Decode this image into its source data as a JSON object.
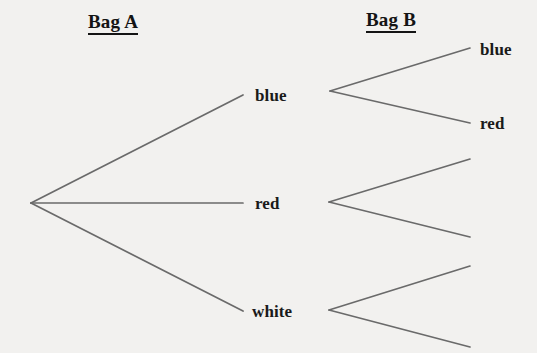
{
  "canvas": {
    "width": 537,
    "height": 353,
    "background_color": "#f2f1ef",
    "line_color": "#6a6a6a",
    "text_color": "#1a1a1a"
  },
  "headings": [
    {
      "id": "bag-a",
      "label": "Bag A",
      "x": 88,
      "y": 12
    },
    {
      "id": "bag-b",
      "label": "Bag B",
      "x": 366,
      "y": 10
    }
  ],
  "nodes": {
    "root": {
      "id": "root",
      "label": "",
      "x": 30,
      "y": 203
    },
    "stage1": [
      {
        "id": "stage1-blue",
        "label": "blue",
        "x": 255,
        "y": 95,
        "label_x": 255,
        "label_y": 87
      },
      {
        "id": "stage1-red",
        "label": "red",
        "x": 255,
        "y": 203,
        "label_x": 255,
        "label_y": 195
      },
      {
        "id": "stage1-white",
        "label": "white",
        "x": 255,
        "y": 311,
        "label_x": 252,
        "label_y": 303
      }
    ],
    "stage2": [
      {
        "id": "stage2-blue-blue",
        "label": "blue",
        "x": 480,
        "y": 48,
        "label_x": 480,
        "label_y": 41
      },
      {
        "id": "stage2-blue-red",
        "label": "red",
        "x": 480,
        "y": 123,
        "label_x": 480,
        "label_y": 115
      },
      {
        "id": "stage2-red-1",
        "label": "",
        "x": 470,
        "y": 160,
        "label_x": 0,
        "label_y": 0
      },
      {
        "id": "stage2-red-2",
        "label": "",
        "x": 470,
        "y": 238,
        "label_x": 0,
        "label_y": 0
      },
      {
        "id": "stage2-white-1",
        "label": "",
        "x": 470,
        "y": 266,
        "label_x": 0,
        "label_y": 0
      },
      {
        "id": "stage2-white-2",
        "label": "",
        "x": 470,
        "y": 345,
        "label_x": 0,
        "label_y": 0
      }
    ]
  },
  "chart_data": {
    "type": "diagram",
    "diagram_kind": "tree",
    "stages": [
      "Bag A",
      "Bag B"
    ],
    "structure": {
      "root_children": [
        "blue",
        "red",
        "white"
      ],
      "branches": [
        {
          "stage1_outcome": "blue",
          "stage2_outcomes": [
            "blue",
            "red"
          ]
        },
        {
          "stage1_outcome": "red",
          "stage2_outcomes": [
            "",
            ""
          ]
        },
        {
          "stage1_outcome": "white",
          "stage2_outcomes": [
            "",
            ""
          ]
        }
      ]
    },
    "edges": [
      {
        "id": "edge-root-blue",
        "from": "root",
        "to": "stage1-blue",
        "x1": 31,
        "y1": 203,
        "x2": 243,
        "y2": 95
      },
      {
        "id": "edge-root-red",
        "from": "root",
        "to": "stage1-red",
        "x1": 31,
        "y1": 203,
        "x2": 243,
        "y2": 203
      },
      {
        "id": "edge-root-white",
        "from": "root",
        "to": "stage1-white",
        "x1": 31,
        "y1": 203,
        "x2": 243,
        "y2": 311
      },
      {
        "id": "edge-blue-up",
        "from": "stage1-blue",
        "to": "stage2-blue-blue",
        "x1": 330,
        "y1": 91,
        "x2": 470,
        "y2": 48
      },
      {
        "id": "edge-blue-down",
        "from": "stage1-blue",
        "to": "stage2-blue-red",
        "x1": 330,
        "y1": 91,
        "x2": 470,
        "y2": 123
      },
      {
        "id": "edge-red-up",
        "from": "stage1-red",
        "to": "stage2-red-1",
        "x1": 329,
        "y1": 202,
        "x2": 470,
        "y2": 159
      },
      {
        "id": "edge-red-down",
        "from": "stage1-red",
        "to": "stage2-red-2",
        "x1": 329,
        "y1": 202,
        "x2": 470,
        "y2": 237
      },
      {
        "id": "edge-white-up",
        "from": "stage1-white",
        "to": "stage2-white-1",
        "x1": 329,
        "y1": 310,
        "x2": 470,
        "y2": 266
      },
      {
        "id": "edge-white-down",
        "from": "stage1-white",
        "to": "stage2-white-2",
        "x1": 329,
        "y1": 310,
        "x2": 470,
        "y2": 347
      }
    ],
    "labels": {
      "stage1": [
        "blue",
        "red",
        "white"
      ],
      "stage2_top_group": [
        "blue",
        "red"
      ],
      "stage2_middle_group": [
        "",
        ""
      ],
      "stage2_bottom_group": [
        "",
        ""
      ]
    }
  }
}
